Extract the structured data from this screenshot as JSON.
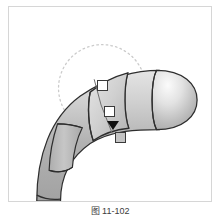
{
  "figure": {
    "caption": "图 11-102",
    "panel_background": "#ffffff",
    "panel_border_color": "#d6d6d6"
  },
  "viewport": {
    "name": "3d-viewport",
    "background": "#ffffff"
  },
  "gizmo": {
    "rotation_circle": {
      "label": "rotation-influence-circle",
      "style": "dotted",
      "color": "#c9c9c9",
      "center_x": 102,
      "center_y": 88,
      "radius": 44
    },
    "handles": [
      {
        "label": "handle-top",
        "state": "unselected",
        "fill": "#ffffff",
        "stroke": "#3a3a3a",
        "x": 88,
        "y": 73
      },
      {
        "label": "handle-middle",
        "state": "unselected",
        "fill": "#ffffff",
        "stroke": "#3a3a3a",
        "x": 95,
        "y": 99
      },
      {
        "label": "handle-bottom",
        "state": "selected",
        "fill": "#c4c4c4",
        "stroke": "#3a3a3a",
        "x": 106,
        "y": 125
      }
    ],
    "arrow": {
      "label": "manipulator-arrow",
      "direction": "down",
      "color": "#111111"
    },
    "connector_color": "#6d6d6d"
  },
  "model": {
    "name": "segmented-tube",
    "description": "curved tapered tube with rounded cap head",
    "body_fill_light": "#e9e9e9",
    "body_fill_mid": "#b9b9b9",
    "body_fill_dark": "#9a9a9a",
    "outline_color": "#2e2e2e",
    "segments": [
      {
        "label": "segment-head",
        "selected": false
      },
      {
        "label": "segment-neck",
        "selected": false
      },
      {
        "label": "segment-active",
        "selected": true
      },
      {
        "label": "segment-mid",
        "selected": false
      },
      {
        "label": "segment-lower",
        "selected": false
      },
      {
        "label": "segment-tail",
        "selected": false
      }
    ]
  }
}
